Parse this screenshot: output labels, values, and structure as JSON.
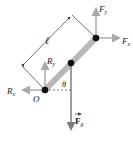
{
  "diagram": {
    "type": "free-body diagram of a rod pivoted at O",
    "labels": {
      "length": "ℓ",
      "pivot": "O",
      "angle": "θ",
      "fy_main": "F",
      "fy_sub": "y",
      "fx_main": "F",
      "fx_sub": "x",
      "ry_main": "R",
      "ry_sub": "y",
      "rx_main": "R",
      "rx_sub": "x",
      "fg_main": "F",
      "fg_sub": "g"
    },
    "colors": {
      "rod": "#b8b8b8",
      "arrow": "#a9a9a9",
      "gravity_arrow": "#7d7d7d",
      "dot": "#111111",
      "line": "#333333"
    }
  }
}
